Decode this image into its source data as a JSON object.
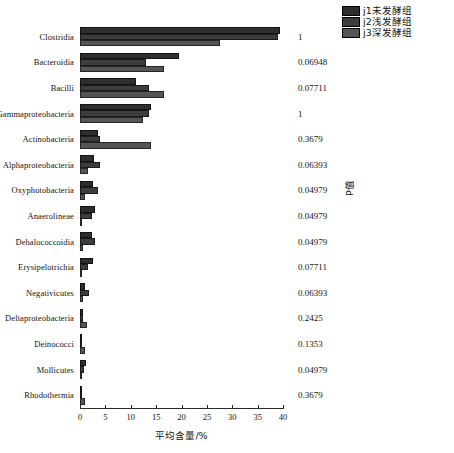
{
  "chart_data": {
    "type": "bar",
    "orientation": "horizontal",
    "title": "",
    "xlabel": "平均含量/%",
    "ylabel": "",
    "xlim": [
      0,
      40
    ],
    "xticks": [
      0,
      5,
      10,
      15,
      20,
      25,
      30,
      35,
      40
    ],
    "grid": false,
    "legend_position": "top-right",
    "categories": [
      "Clostridia",
      "Bacteroidia",
      "Bacilli",
      "Gammaproteobacteria",
      "Actinobacteria",
      "Alphaproteobacteria",
      "Oxyphotobacteria",
      "Anaerolineae",
      "Dehalococcoidia",
      "Erysipelotrichia",
      "Negativicutes",
      "Deltaproteobacteria",
      "Deinococci",
      "Mollicutes",
      "Rhodothermia"
    ],
    "series": [
      {
        "name": "j1未发酵组",
        "color": "#2e2e2e",
        "values": [
          39.5,
          19.5,
          11.0,
          14.0,
          3.5,
          2.8,
          2.5,
          3.0,
          2.3,
          2.5,
          1.0,
          0.5,
          0.15,
          1.2,
          0.2
        ]
      },
      {
        "name": "j2浅发酵组",
        "color": "#3d3d3d",
        "values": [
          39.0,
          13.0,
          13.5,
          13.6,
          4.0,
          3.9,
          3.6,
          2.3,
          3.0,
          1.6,
          1.7,
          0.5,
          0.2,
          0.8,
          0.2
        ]
      },
      {
        "name": "j3深发酵组",
        "color": "#555555",
        "values": [
          27.5,
          16.5,
          16.5,
          12.5,
          14.0,
          1.5,
          0.9,
          0.3,
          0.5,
          0.4,
          0.6,
          1.3,
          1.0,
          0.15,
          1.0
        ]
      }
    ],
    "annotation_column": {
      "title": "P值",
      "values": [
        "1",
        "0.06948",
        "0.07711",
        "1",
        "0.3679",
        "0.06393",
        "0.04979",
        "0.04979",
        "0.04979",
        "0.07711",
        "0.06393",
        "0.2425",
        "0.1353",
        "0.04979",
        "0.3679"
      ]
    }
  }
}
